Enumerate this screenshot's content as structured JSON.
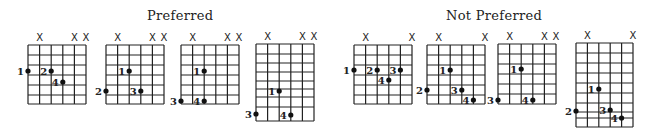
{
  "headings": {
    "preferred": "Preferred",
    "not_preferred": "Not Preferred"
  },
  "diagram_style": {
    "line_color": "#222222",
    "dot_color": "#111111",
    "background": "#ffffff"
  },
  "diagrams": [
    {
      "group": "preferred",
      "x": 28,
      "y": 45,
      "width": 58,
      "row_lines": [
        45,
        55,
        65,
        75,
        85,
        95,
        104
      ],
      "mute_strings": [
        2,
        5,
        6
      ],
      "dots": [
        {
          "finger": "1",
          "string": 1,
          "y": 71
        },
        {
          "finger": "2",
          "string": 3,
          "y": 71
        },
        {
          "finger": "4",
          "string": 4,
          "y": 82
        }
      ]
    },
    {
      "group": "preferred",
      "x": 106,
      "y": 45,
      "width": 58,
      "row_lines": [
        45,
        55,
        65,
        75,
        85,
        95,
        104
      ],
      "mute_strings": [
        2,
        5,
        6
      ],
      "dots": [
        {
          "finger": "1",
          "string": 3,
          "y": 71
        },
        {
          "finger": "2",
          "string": 1,
          "y": 91
        },
        {
          "finger": "3",
          "string": 4,
          "y": 91
        }
      ]
    },
    {
      "group": "preferred",
      "x": 181,
      "y": 45,
      "width": 58,
      "row_lines": [
        45,
        55,
        65,
        75,
        85,
        95,
        104
      ],
      "mute_strings": [
        2,
        5,
        6
      ],
      "dots": [
        {
          "finger": "1",
          "string": 3,
          "y": 71
        },
        {
          "finger": "3",
          "string": 1,
          "y": 101
        },
        {
          "finger": "4",
          "string": 3,
          "y": 101
        }
      ]
    },
    {
      "group": "preferred",
      "x": 256,
      "y": 44,
      "width": 58,
      "row_lines": [
        44,
        54,
        63,
        72,
        81,
        89,
        97,
        107,
        121
      ],
      "mute_strings": [
        2,
        5,
        6
      ],
      "dots": [
        {
          "finger": "1",
          "string": 3,
          "y": 91
        },
        {
          "finger": "3",
          "string": 1,
          "y": 114
        },
        {
          "finger": "4",
          "string": 4,
          "y": 115
        }
      ]
    },
    {
      "group": "not_preferred",
      "x": 354,
      "y": 45,
      "width": 58,
      "row_lines": [
        45,
        55,
        65,
        75,
        85,
        95,
        104
      ],
      "mute_strings": [
        2,
        6
      ],
      "dots": [
        {
          "finger": "1",
          "string": 1,
          "y": 70
        },
        {
          "finger": "2",
          "string": 3,
          "y": 70
        },
        {
          "finger": "3",
          "string": 5,
          "y": 70
        },
        {
          "finger": "4",
          "string": 4,
          "y": 80
        }
      ]
    },
    {
      "group": "not_preferred",
      "x": 427,
      "y": 45,
      "width": 58,
      "row_lines": [
        45,
        55,
        65,
        75,
        85,
        95,
        104
      ],
      "mute_strings": [
        2,
        6
      ],
      "dots": [
        {
          "finger": "1",
          "string": 3,
          "y": 70
        },
        {
          "finger": "2",
          "string": 1,
          "y": 90
        },
        {
          "finger": "3",
          "string": 4,
          "y": 90
        },
        {
          "finger": "4",
          "string": 5,
          "y": 100
        }
      ]
    },
    {
      "group": "not_preferred",
      "x": 498,
      "y": 44,
      "width": 58,
      "row_lines": [
        44,
        54,
        64,
        74,
        84,
        94,
        104
      ],
      "mute_strings": [
        2,
        5,
        6
      ],
      "dots": [
        {
          "finger": "1",
          "string": 3,
          "y": 69
        },
        {
          "finger": "3",
          "string": 1,
          "y": 100
        },
        {
          "finger": "4",
          "string": 4,
          "y": 100
        }
      ]
    },
    {
      "group": "not_preferred",
      "x": 576,
      "y": 43,
      "width": 57,
      "row_lines": [
        43,
        53,
        63,
        73,
        83,
        93,
        103,
        112,
        118,
        127
      ],
      "mute_strings": [
        2,
        6
      ],
      "dots": [
        {
          "finger": "1",
          "string": 3,
          "y": 89
        },
        {
          "finger": "2",
          "string": 1,
          "y": 111
        },
        {
          "finger": "3",
          "string": 4,
          "y": 110
        },
        {
          "finger": "4",
          "string": 5,
          "y": 118
        }
      ]
    }
  ],
  "labels": {
    "mute_symbol": "X"
  }
}
